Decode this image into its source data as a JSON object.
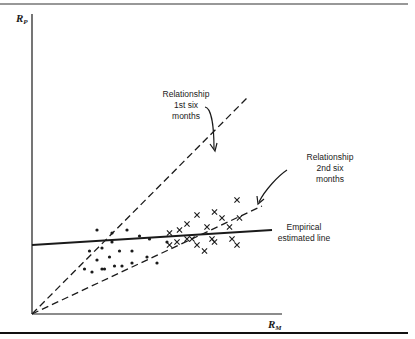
{
  "figure": {
    "y_axis_label": {
      "main": "R",
      "sub": "P"
    },
    "x_axis_label": {
      "main": "R",
      "sub": "M"
    },
    "annotations": {
      "first_half": [
        "Relationship",
        "1st six",
        "months"
      ],
      "second_half": [
        "Relationship",
        "2nd six",
        "months"
      ],
      "empirical": [
        "Empirical",
        "estimated line"
      ]
    },
    "ink_color": "#1a1a1a"
  },
  "chart_data": {
    "type": "scatter",
    "title": "",
    "xlabel": "R_M",
    "ylabel": "R_P",
    "xlim": [
      0,
      100
    ],
    "ylim": [
      0,
      100
    ],
    "grid": false,
    "legend": "none",
    "series": [
      {
        "name": "1st six months",
        "marker": "dot",
        "points": [
          [
            26,
            28
          ],
          [
            32,
            27
          ],
          [
            38,
            28
          ],
          [
            43,
            26
          ],
          [
            47,
            25
          ],
          [
            28,
            22
          ],
          [
            23,
            21
          ],
          [
            35,
            21
          ],
          [
            40,
            21
          ],
          [
            31,
            19
          ],
          [
            46,
            19
          ],
          [
            26,
            18
          ],
          [
            33,
            16
          ],
          [
            40,
            17
          ],
          [
            36,
            16
          ],
          [
            28,
            15
          ],
          [
            21,
            15
          ],
          [
            24,
            14
          ],
          [
            29,
            15
          ],
          [
            50,
            17
          ],
          [
            54,
            24
          ],
          [
            32,
            24
          ]
        ]
      },
      {
        "name": "2nd six months",
        "marker": "cross",
        "points": [
          [
            82,
            38
          ],
          [
            73,
            34
          ],
          [
            66,
            33
          ],
          [
            76,
            32
          ],
          [
            79,
            29
          ],
          [
            83,
            32
          ],
          [
            62,
            30
          ],
          [
            70,
            29
          ],
          [
            55,
            27
          ],
          [
            59,
            28
          ],
          [
            62,
            25
          ],
          [
            64,
            25
          ],
          [
            72,
            25
          ],
          [
            80,
            25
          ],
          [
            73,
            24
          ],
          [
            58,
            24
          ],
          [
            66,
            23
          ],
          [
            69,
            21
          ],
          [
            82,
            23
          ],
          [
            55,
            23
          ]
        ]
      }
    ],
    "lines": [
      {
        "name": "Relationship 1st six months",
        "style": "dashed",
        "from": [
          0,
          0
        ],
        "to": [
          86,
          72
        ]
      },
      {
        "name": "Relationship 2nd six months",
        "style": "dashed",
        "from": [
          0,
          0
        ],
        "to": [
          92,
          36
        ]
      },
      {
        "name": "Empirical estimated line",
        "style": "solid",
        "from": [
          0,
          23
        ],
        "to": [
          96,
          28
        ]
      }
    ]
  }
}
